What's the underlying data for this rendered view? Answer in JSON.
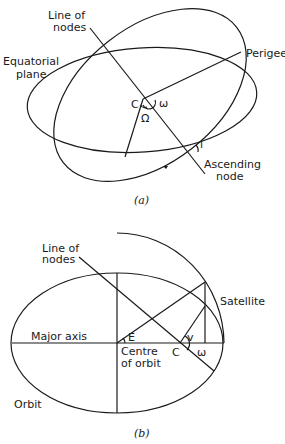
{
  "figure_a": {
    "caption": "(a)",
    "labels": {
      "line_of_nodes_1": "Line of",
      "line_of_nodes_2": "nodes",
      "equatorial_1": "Equatorial",
      "equatorial_2": "plane",
      "perigee": "Perigee",
      "center": "C",
      "omega": "ω",
      "raan": "Ω",
      "inclination": "i",
      "ascending_1": "Ascending",
      "ascending_2": "node"
    }
  },
  "figure_b": {
    "caption": "(b)",
    "labels": {
      "line_of_nodes_1": "Line of",
      "line_of_nodes_2": "nodes",
      "satellite": "Satellite",
      "major_axis": "Major axis",
      "eccentric_anomaly": "E",
      "true_anomaly": "v",
      "center": "C",
      "omega": "ω",
      "centre_1": "Centre",
      "centre_2": "of orbit",
      "orbit": "Orbit"
    }
  }
}
